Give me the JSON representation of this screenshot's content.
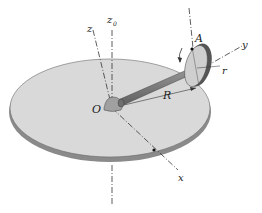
{
  "figure": {
    "labels": {
      "z0": "z",
      "z0_sub": "0",
      "z": "z",
      "x": "x",
      "y": "y",
      "A": "A",
      "O": "O",
      "R": "R",
      "r": "r"
    },
    "colors": {
      "disc_top": "#d9d9d9",
      "disc_edge": "#8a8a8a",
      "shaft": "#7d7d7d",
      "wheel_face": "#cfcfcf",
      "wheel_rim": "#555555",
      "hub": "#a0a0a0"
    }
  }
}
